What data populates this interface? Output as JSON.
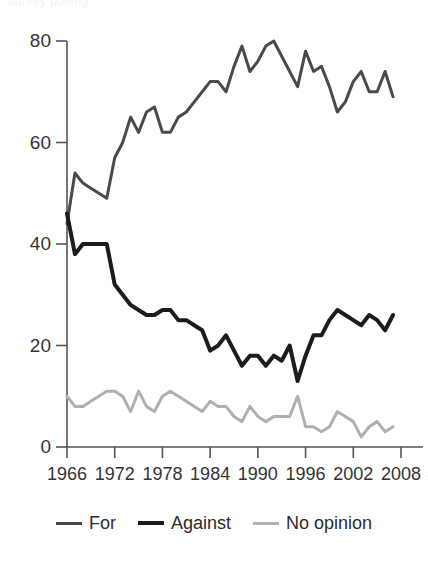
{
  "page": {
    "top_artifact_text": "survey polling"
  },
  "legend": {
    "position": "bottom-center",
    "items": [
      {
        "label": "For",
        "color": "#4a4a4a",
        "width": 3
      },
      {
        "label": "Against",
        "color": "#1c1c1c",
        "width": 4
      },
      {
        "label": "No opinion",
        "color": "#b0b0b0",
        "width": 3
      }
    ]
  },
  "chart_data": {
    "type": "line",
    "title": "",
    "subtitle": "",
    "xlabel": "",
    "ylabel": "",
    "xlim": [
      1966,
      2008
    ],
    "ylim": [
      0,
      80
    ],
    "grid": false,
    "legend_position": "bottom-center",
    "y_ticks": [
      0,
      20,
      40,
      60,
      80
    ],
    "y_tick_labels": [
      "0",
      "20",
      "40",
      "60",
      "80"
    ],
    "x_ticks": [
      1966,
      1972,
      1978,
      1984,
      1990,
      1996,
      2002,
      2008
    ],
    "x_tick_labels": [
      "1966",
      "1972",
      "1978",
      "1984",
      "1990",
      "1996",
      "2002",
      "2008"
    ],
    "x": [
      1966,
      1967,
      1968,
      1969,
      1970,
      1971,
      1972,
      1973,
      1974,
      1975,
      1976,
      1977,
      1978,
      1979,
      1980,
      1981,
      1982,
      1983,
      1984,
      1985,
      1986,
      1987,
      1988,
      1989,
      1990,
      1991,
      1992,
      1993,
      1994,
      1995,
      1996,
      1997,
      1998,
      1999,
      2000,
      2001,
      2002,
      2003,
      2004,
      2005,
      2006,
      2007
    ],
    "series": [
      {
        "name": "For",
        "color": "#4a4a4a",
        "width": 3,
        "values": [
          44,
          54,
          52,
          51,
          50,
          49,
          57,
          60,
          65,
          62,
          66,
          67,
          62,
          62,
          65,
          66,
          68,
          70,
          72,
          72,
          70,
          75,
          79,
          74,
          76,
          79,
          80,
          77,
          74,
          71,
          78,
          74,
          75,
          71,
          66,
          68,
          72,
          74,
          70,
          70,
          74,
          69
        ]
      },
      {
        "name": "Against",
        "color": "#1c1c1c",
        "width": 4,
        "values": [
          46,
          38,
          40,
          40,
          40,
          40,
          32,
          30,
          28,
          27,
          26,
          26,
          27,
          27,
          25,
          25,
          24,
          23,
          19,
          20,
          22,
          19,
          16,
          18,
          18,
          16,
          18,
          17,
          20,
          13,
          18,
          22,
          22,
          25,
          27,
          26,
          25,
          24,
          26,
          25,
          23,
          26
        ]
      },
      {
        "name": "No opinion",
        "color": "#b0b0b0",
        "width": 3,
        "values": [
          10,
          8,
          8,
          9,
          10,
          11,
          11,
          10,
          7,
          11,
          8,
          7,
          10,
          11,
          10,
          9,
          8,
          7,
          9,
          8,
          8,
          6,
          5,
          8,
          6,
          5,
          6,
          6,
          6,
          10,
          4,
          4,
          3,
          4,
          7,
          6,
          5,
          2,
          4,
          5,
          3,
          4
        ]
      }
    ]
  }
}
